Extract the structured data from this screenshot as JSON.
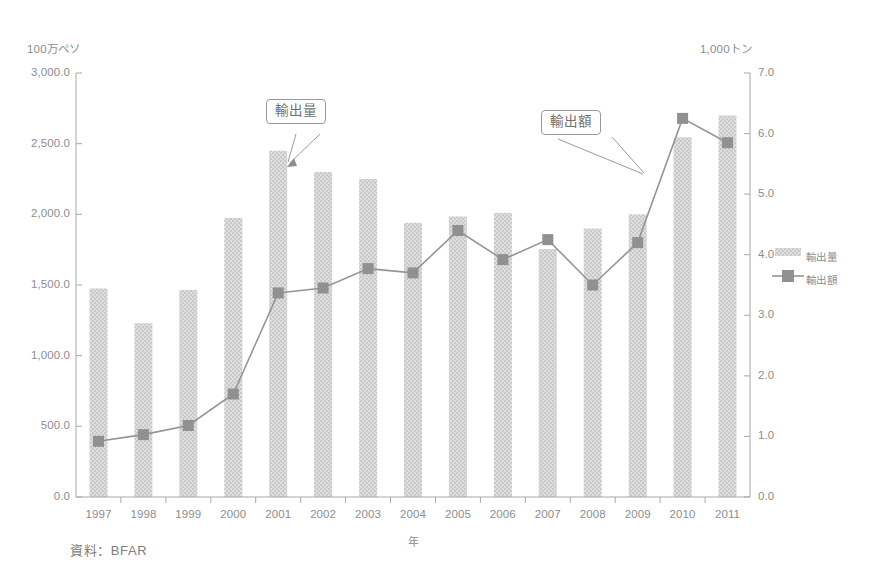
{
  "chart_data": {
    "type": "bar",
    "title": "",
    "subtitle": "",
    "xlabel": "年",
    "ylabel": "100万ペソ",
    "y2label": "1,000トン",
    "categories": [
      "1997",
      "1998",
      "1999",
      "2000",
      "2001",
      "2002",
      "2003",
      "2004",
      "2005",
      "2006",
      "2007",
      "2008",
      "2009",
      "2010",
      "2011"
    ],
    "series": [
      {
        "name": "輸出量",
        "type": "bar",
        "axis": "left",
        "unit": "100万ペソ",
        "values": [
          1475,
          1230,
          1465,
          1975,
          2450,
          2300,
          2250,
          1940,
          1985,
          2010,
          1755,
          1900,
          2000,
          2545,
          2700
        ]
      },
      {
        "name": "輸出額",
        "type": "line",
        "axis": "right",
        "unit": "1,000トン",
        "values": [
          0.92,
          1.03,
          1.18,
          1.7,
          3.37,
          3.45,
          3.77,
          3.7,
          4.4,
          3.92,
          4.25,
          3.5,
          4.2,
          6.25,
          5.85
        ]
      }
    ],
    "ylim": [
      0.0,
      3000.0
    ],
    "y2lim": [
      0.0,
      7.0
    ],
    "yticks": [
      "0.0",
      "500.0",
      "1,000.0",
      "1,500.0",
      "2,000.0",
      "2,500.0",
      "3,000.0"
    ],
    "ytick_values": [
      0,
      500,
      1000,
      1500,
      2000,
      2500,
      3000
    ],
    "y2ticks": [
      "0.0",
      "1.0",
      "2.0",
      "3.0",
      "4.0",
      "5.0",
      "6.0",
      "7.0"
    ],
    "y2tick_values": [
      0,
      1,
      2,
      3,
      4,
      5,
      6,
      7
    ],
    "grid": false,
    "legend": {
      "position": "right",
      "entries": [
        {
          "label": "輸出量",
          "marker": "bar-swatch"
        },
        {
          "label": "輸出額",
          "marker": "line-square-marker"
        }
      ]
    },
    "annotations": [
      {
        "text": "輸出量",
        "points_to": "2001 bar top",
        "id": "callout-volume"
      },
      {
        "text": "輸出額",
        "points_to": "2009-2010 line segment",
        "id": "callout-value"
      }
    ],
    "colors": {
      "bar_fill": "#d6d6d6",
      "bar_texture": "#c4c4c4",
      "line": "#8f8f8f",
      "marker": "#8a8a8a",
      "axis": "#a8a8a8",
      "text": "#8d8d8d"
    }
  },
  "source": {
    "note": "資料：BFAR"
  }
}
